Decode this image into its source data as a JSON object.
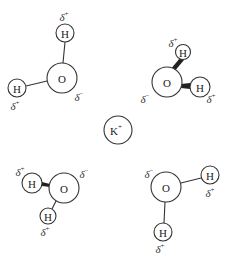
{
  "diagram": {
    "title": "",
    "central_ion": {
      "label": "K",
      "charge": "+"
    },
    "atom_labels": {
      "oxygen": "O",
      "hydrogen": "H"
    },
    "partial_charges": {
      "positive": "δ",
      "positive_sign": "+",
      "negative": "δ",
      "negative_sign": "−"
    },
    "molecules": [
      {
        "name": "water-top-left",
        "oxygen_charge": "δ−",
        "hydrogen_charges": [
          "δ+",
          "δ+"
        ]
      },
      {
        "name": "water-top-right",
        "oxygen_charge": "δ−",
        "hydrogen_charges": [
          "δ+",
          "δ+"
        ]
      },
      {
        "name": "water-bottom-left",
        "oxygen_charge": "δ−",
        "hydrogen_charges": [
          "δ+",
          "δ+"
        ]
      },
      {
        "name": "water-bottom-right",
        "oxygen_charge": "δ−",
        "hydrogen_charges": [
          "δ+",
          "δ+"
        ]
      }
    ],
    "colors": {
      "stroke": "#333333",
      "text": "#222222",
      "background": "#ffffff"
    }
  }
}
